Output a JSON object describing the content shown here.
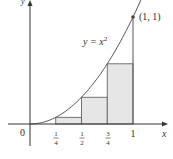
{
  "chart_data": {
    "type": "area",
    "title": "",
    "curve_label": "y = x²",
    "curve_label_base": "y = x",
    "curve_label_exp": "2",
    "xlabel": "x",
    "ylabel": "y",
    "origin_label": "0",
    "point_label": "(1, 1)",
    "xlim": [
      0,
      1
    ],
    "ylim": [
      0,
      1
    ],
    "grid": false,
    "legend": "none",
    "x_ticks": [
      {
        "num": "1",
        "den": "4",
        "value": 0.25
      },
      {
        "num": "1",
        "den": "2",
        "value": 0.5
      },
      {
        "num": "3",
        "den": "4",
        "value": 0.75
      },
      {
        "label": "1",
        "value": 1
      }
    ],
    "rectangles": [
      {
        "x0": 0.25,
        "x1": 0.5,
        "height": 0.0625
      },
      {
        "x0": 0.5,
        "x1": 0.75,
        "height": 0.25
      },
      {
        "x0": 0.75,
        "x1": 1.0,
        "height": 0.5625
      }
    ],
    "curve": {
      "function": "x^2",
      "x": [
        0,
        0.25,
        0.5,
        0.75,
        1.0,
        1.1
      ],
      "y": [
        0,
        0.0625,
        0.25,
        0.5625,
        1.0,
        1.21
      ]
    },
    "highlight_point": {
      "x": 1,
      "y": 1
    }
  },
  "colors": {
    "axis": "#333333",
    "curve": "#555555",
    "rect_fill": "#e6e6e6",
    "rect_stroke": "#555555"
  }
}
